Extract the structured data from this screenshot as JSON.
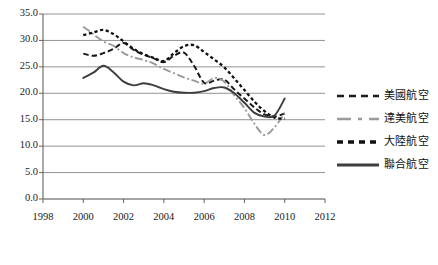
{
  "chart_data": {
    "type": "line",
    "title": "",
    "xlabel": "",
    "ylabel": "",
    "xlim": [
      1998,
      2012
    ],
    "ylim": [
      0.0,
      35.0
    ],
    "grid": true,
    "legend_position": "right",
    "x_ticks": [
      "1998",
      "2000",
      "2002",
      "2004",
      "2006",
      "2008",
      "2010",
      "2012"
    ],
    "y_ticks": [
      "0.0",
      "5.0",
      "10.0",
      "15.0",
      "20.0",
      "25.0",
      "30.0",
      "35.0"
    ],
    "x": [
      2000,
      2000.5,
      2001,
      2001.5,
      2002,
      2002.5,
      2003,
      2003.5,
      2004,
      2004.5,
      2005,
      2005.5,
      2006,
      2006.5,
      2007,
      2007.5,
      2008,
      2008.5,
      2009,
      2009.5,
      2010
    ],
    "series": [
      {
        "name": "美國航空",
        "color": "#1a1a1a",
        "style": "dashed",
        "values": [
          27.5,
          27.1,
          27.6,
          28.4,
          29.5,
          28.2,
          27.3,
          26.6,
          25.9,
          27.1,
          27.7,
          25.2,
          22.0,
          22.4,
          22.6,
          20.7,
          19.0,
          17.3,
          16.0,
          15.6,
          16.2
        ]
      },
      {
        "name": "達美航空",
        "color": "#9a9a9a",
        "style": "dash-dot",
        "values": [
          32.6,
          31.2,
          29.8,
          29.0,
          27.6,
          26.8,
          26.3,
          25.6,
          24.6,
          23.8,
          23.0,
          22.4,
          21.8,
          22.9,
          22.2,
          19.6,
          17.2,
          14.2,
          12.1,
          13.6,
          16.2
        ]
      },
      {
        "name": "大陸航空",
        "color": "#111111",
        "style": "dotted",
        "values": [
          31.0,
          31.5,
          32.0,
          31.2,
          29.8,
          28.4,
          27.4,
          26.7,
          26.1,
          27.6,
          28.9,
          29.1,
          27.8,
          26.4,
          24.9,
          22.8,
          20.6,
          18.4,
          16.6,
          15.4,
          15.2
        ]
      },
      {
        "name": "聯合航空",
        "color": "#3d3d3d",
        "style": "solid",
        "values": [
          22.9,
          23.9,
          25.2,
          24.0,
          22.2,
          21.5,
          21.9,
          21.5,
          20.8,
          20.3,
          20.1,
          20.1,
          20.4,
          21.0,
          21.1,
          20.0,
          18.2,
          16.3,
          15.6,
          15.8,
          19.0
        ]
      }
    ]
  }
}
